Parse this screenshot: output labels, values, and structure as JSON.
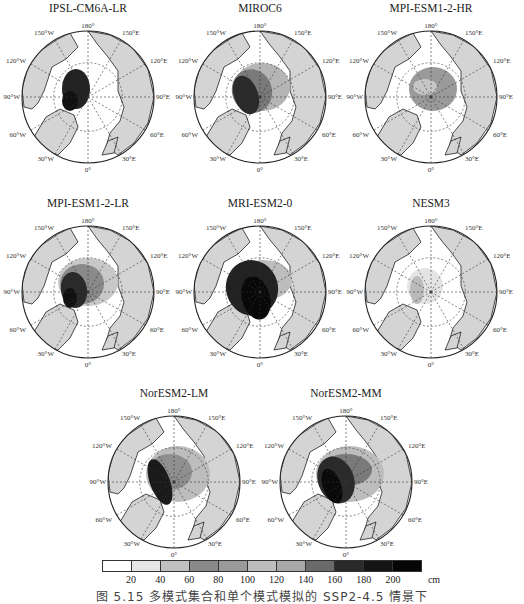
{
  "chart_data": {
    "type": "heatmap",
    "title": "",
    "panels": [
      {
        "model": "IPSL-CM6A-LR",
        "pattern": "thick ice (>180 cm) confined to Canadian Arctic Archipelago / north of Greenland; rest of ocean mostly <20 cm",
        "max_cm": 200
      },
      {
        "model": "MIROC6",
        "pattern": "thick ice 160-200 cm north of Canadian Archipelago, grading to 60-100 cm across central Arctic, thin toward Siberian side",
        "max_cm": 200
      },
      {
        "model": "MPI-ESM1-2-HR",
        "pattern": "moderate 60-120 cm ice patch over central Arctic, thin elsewhere",
        "max_cm": 120
      },
      {
        "model": "MPI-ESM1-2-LR",
        "pattern": "thick ice >180 cm near Canadian Archipelago/Greenland, 60-140 cm over much of central Arctic",
        "max_cm": 200
      },
      {
        "model": "MRI-ESM2-0",
        "pattern": "very thick ice >200 cm covering large part of central Arctic and Canadian side, 100-140 cm toward Siberia",
        "max_cm": 200
      },
      {
        "model": "NESM3",
        "pattern": "thin ice 20-80 cm near Canadian Archipelago, mostly ice-free",
        "max_cm": 80
      },
      {
        "model": "NorESM2-LM",
        "pattern": "thick ice >180 cm along Canadian Archipelago and Greenland coast, 60-120 cm across central Arctic",
        "max_cm": 200
      },
      {
        "model": "NorESM2-MM",
        "pattern": "thick ice >180 cm along Canadian Archipelago, 80-160 cm across central Arctic toward East Siberian Sea",
        "max_cm": 200
      }
    ],
    "map_labels": {
      "top": "180°",
      "bottom": "0°",
      "left": "90°W",
      "right": "90°E",
      "upper_left": "150°W",
      "upper_right": "150°E",
      "mid_left_upper": "120°W",
      "mid_right_upper": "120°E",
      "mid_left_lower": "60°W",
      "mid_right_lower": "60°E",
      "lower_left": "30°W",
      "lower_right": "30°E"
    },
    "colorbar": {
      "ticks": [
        "20",
        "40",
        "60",
        "80",
        "100",
        "120",
        "140",
        "160",
        "180",
        "200"
      ],
      "unit": "cm",
      "colors": [
        "#ffffff",
        "#e6e6e6",
        "#c0c0c0",
        "#8a8a8a",
        "#9a9a9a",
        "#bdbdbd",
        "#a8a8a8",
        "#6a6a6a",
        "#2a2a2a",
        "#141414",
        "#060606"
      ],
      "range": [
        0,
        220
      ]
    },
    "legend_position": "bottom"
  },
  "panels": [
    {
      "title": "IPSL-CM6A-LR"
    },
    {
      "title": "MIROC6"
    },
    {
      "title": "MPI-ESM1-2-HR"
    },
    {
      "title": "MPI-ESM1-2-LR"
    },
    {
      "title": "MRI-ESM2-0"
    },
    {
      "title": "NESM3"
    },
    {
      "title": "NorESM2-LM"
    },
    {
      "title": "NorESM2-MM"
    }
  ],
  "labels": {
    "deg180": "180°",
    "deg0": "0°",
    "w90": "90°W",
    "e90": "90°E",
    "w150": "150°W",
    "e150": "150°E",
    "w120": "120°W",
    "e120": "120°E",
    "w60": "60°W",
    "e60": "60°E",
    "w30": "30°W",
    "e30": "30°E"
  },
  "colorbar": {
    "ticks": [
      "20",
      "40",
      "60",
      "80",
      "100",
      "120",
      "140",
      "160",
      "180",
      "200"
    ],
    "unit": "cm"
  },
  "caption": "图 5.15   多模式集合和单个模式模拟的 SSP2-4.5 情景下"
}
